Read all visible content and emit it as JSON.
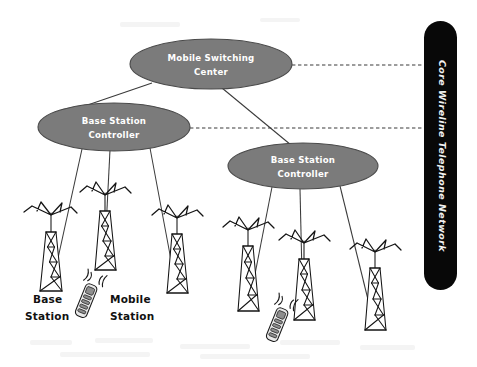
{
  "diagram": {
    "background_color": "#ffffff",
    "ellipse_fill": "#7b7b7b",
    "ellipse_stroke": "#4a4a4a",
    "ellipse_text_color": "#ffffff",
    "core_bar_color": "#080808",
    "core_text_color": "#f2f2f2",
    "line_color": "#3a3a3a",
    "ink_color": "#141414"
  },
  "nodes": {
    "msc": {
      "id": "mobile-switching-center",
      "label_line1": "Mobile Switching",
      "label_line2": "Center",
      "shape": "ellipse",
      "cx": 211,
      "cy": 64,
      "rx": 81,
      "ry": 25
    },
    "bsc_left": {
      "id": "base-station-controller-left",
      "label_line1": "Base Station",
      "label_line2": "Controller",
      "shape": "ellipse",
      "cx": 114,
      "cy": 127,
      "rx": 76,
      "ry": 24
    },
    "bsc_right": {
      "id": "base-station-controller-right",
      "label_line1": "Base Station",
      "label_line2": "Controller",
      "shape": "ellipse",
      "cx": 303,
      "cy": 166,
      "rx": 75,
      "ry": 23
    },
    "core_network": {
      "id": "core-wireline-telephone-network",
      "label": "Core Wireline Telephone Network",
      "shape": "rounded-bar-vertical",
      "x": 424,
      "y": 21,
      "width": 33,
      "height": 269
    }
  },
  "captions": [
    {
      "id": "base-station-caption",
      "line1": "Base",
      "line2": "Station",
      "x": 33,
      "y": 300
    },
    {
      "id": "mobile-station-caption",
      "line1": "Mobile",
      "line2": "Station",
      "x": 110,
      "y": 300
    }
  ],
  "towers": [
    {
      "id": "tower-left-1",
      "x": 48,
      "top": 215,
      "height": 78,
      "group": "left"
    },
    {
      "id": "tower-left-2",
      "x": 103,
      "top": 195,
      "height": 76,
      "group": "left"
    },
    {
      "id": "tower-left-3",
      "x": 174,
      "top": 218,
      "height": 78,
      "group": "left"
    },
    {
      "id": "tower-right-1",
      "x": 245,
      "top": 230,
      "height": 82,
      "group": "right"
    },
    {
      "id": "tower-right-2",
      "x": 301,
      "top": 243,
      "height": 78,
      "group": "right"
    },
    {
      "id": "tower-right-3",
      "x": 372,
      "top": 252,
      "height": 80,
      "group": "right"
    }
  ],
  "mobile_stations": [
    {
      "id": "mobile-station-left",
      "x": 88,
      "y": 296,
      "rotation": 22
    },
    {
      "id": "mobile-station-right",
      "x": 279,
      "y": 320,
      "rotation": 22
    }
  ],
  "links": {
    "solid": [
      {
        "id": "link-msc-bsc-left",
        "from": "msc",
        "to": "bsc_left"
      },
      {
        "id": "link-msc-bsc-right",
        "from": "msc",
        "to": "bsc_right"
      },
      {
        "id": "link-bsc-left-tower-1",
        "from": "bsc_left",
        "to": "tower-left-1"
      },
      {
        "id": "link-bsc-left-tower-2",
        "from": "bsc_left",
        "to": "tower-left-2"
      },
      {
        "id": "link-bsc-left-tower-3",
        "from": "bsc_left",
        "to": "tower-left-3"
      },
      {
        "id": "link-bsc-right-tower-1",
        "from": "bsc_right",
        "to": "tower-right-1"
      },
      {
        "id": "link-bsc-right-tower-2",
        "from": "bsc_right",
        "to": "tower-right-2"
      },
      {
        "id": "link-bsc-right-tower-3",
        "from": "bsc_right",
        "to": "tower-right-3"
      }
    ],
    "dashed": [
      {
        "id": "link-msc-core",
        "from": "msc",
        "to": "core_network",
        "y": 65
      },
      {
        "id": "link-bsc-left-core",
        "from": "bsc_left",
        "to": "core_network",
        "y": 128
      }
    ]
  }
}
